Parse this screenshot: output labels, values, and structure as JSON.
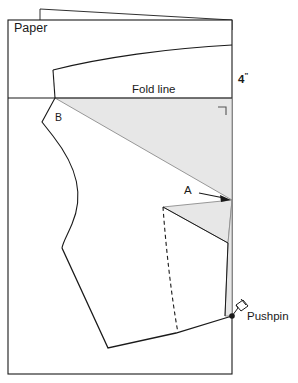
{
  "diagram": {
    "colors": {
      "outline": "#1a1a1a",
      "shaded_fill": "#e7e7e7",
      "shaded_stroke": "#8c8c8c",
      "paper_fill": "#ffffff",
      "background": "#ffffff"
    },
    "labels": {
      "paper": "Paper",
      "fold_line": "Fold line",
      "measurement": "4",
      "measurement_mark": "\"",
      "point_a": "A",
      "point_b": "B",
      "pushpin": "Pushpin"
    },
    "icons": {
      "pushpin": "pushpin-icon",
      "arrow": "arrow-right-icon",
      "right_angle": "right-angle-mark-icon"
    },
    "elements": {
      "paper_sheet": "paper-sheet",
      "fold_flap": "fold-flap-sliver",
      "fold_line": "fold-line",
      "upper_shaded_triangle": "upper-shaded-triangle",
      "lower_shaded_triangle": "lower-shaded-triangle",
      "pattern_outline": "pattern-piece-outline",
      "dashed_guide": "dashed-guide-line",
      "pivot_point": "pushpin-pivot-point"
    }
  }
}
